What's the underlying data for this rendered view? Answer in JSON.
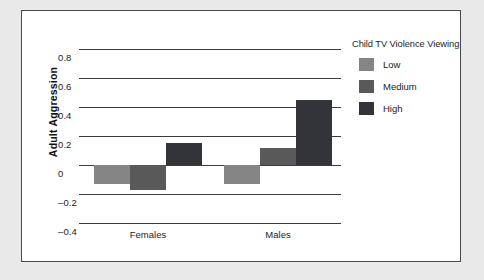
{
  "chart_data": {
    "type": "bar",
    "title": "",
    "xlabel": "",
    "ylabel": "Adult Aggression",
    "categories": [
      "Females",
      "Males"
    ],
    "ylim": [
      -0.4,
      0.8
    ],
    "yticks": [
      "0.8",
      "0.6",
      "0.4",
      "0.2",
      "0",
      "–0.2",
      "–0.4"
    ],
    "ytick_values": [
      0.8,
      0.6,
      0.4,
      0.2,
      0,
      -0.2,
      -0.4
    ],
    "grid": true,
    "legend_position": "right",
    "legend_title": "Child TV Violence Viewing",
    "series": [
      {
        "name": "Low",
        "color": "#858585",
        "values": [
          -0.13,
          -0.13
        ]
      },
      {
        "name": "Medium",
        "color": "#595959",
        "values": [
          -0.17,
          0.12
        ]
      },
      {
        "name": "High",
        "color": "#33333a",
        "values": [
          0.15,
          0.45
        ]
      }
    ]
  },
  "colors": {
    "frame_border": "#4a4a4a",
    "gridline": "#3b3b3b",
    "page_background": "#e9e9e9",
    "plot_background": "#ffffff",
    "text": "#1d1d1d"
  }
}
